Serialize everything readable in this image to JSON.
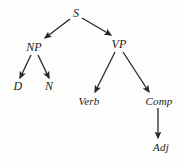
{
  "diagram": {
    "background_color": "#fdfdfb",
    "stroke_color": "#262626",
    "text_color": "#1b1b1b",
    "nodes": [
      {
        "id": "S",
        "label": "S",
        "x": 76,
        "y": 13,
        "font_size": 12
      },
      {
        "id": "NP",
        "label": "NP",
        "x": 34,
        "y": 47,
        "font_size": 12
      },
      {
        "id": "VP",
        "label": "VP",
        "x": 119,
        "y": 44,
        "font_size": 12
      },
      {
        "id": "D",
        "label": "D",
        "x": 18,
        "y": 86,
        "font_size": 12
      },
      {
        "id": "N",
        "label": "N",
        "x": 49,
        "y": 86,
        "font_size": 12
      },
      {
        "id": "Verb",
        "label": "Verb",
        "x": 89,
        "y": 101,
        "font_size": 11
      },
      {
        "id": "Comp",
        "label": "Comp",
        "x": 159,
        "y": 101,
        "font_size": 11
      },
      {
        "id": "Adj",
        "label": "Adj",
        "x": 161,
        "y": 147,
        "font_size": 11
      }
    ],
    "edges": [
      {
        "from": "S",
        "to": "NP",
        "x1": 70,
        "y1": 19,
        "x2": 45,
        "y2": 38
      },
      {
        "from": "S",
        "to": "VP",
        "x1": 82,
        "y1": 18,
        "x2": 111,
        "y2": 35
      },
      {
        "from": "NP",
        "to": "D",
        "x1": 31,
        "y1": 55,
        "x2": 20,
        "y2": 78
      },
      {
        "from": "NP",
        "to": "N",
        "x1": 38,
        "y1": 55,
        "x2": 49,
        "y2": 78
      },
      {
        "from": "VP",
        "to": "Verb",
        "x1": 115,
        "y1": 52,
        "x2": 95,
        "y2": 92
      },
      {
        "from": "VP",
        "to": "Comp",
        "x1": 123,
        "y1": 52,
        "x2": 149,
        "y2": 92
      },
      {
        "from": "Comp",
        "to": "Adj",
        "x1": 158,
        "y1": 108,
        "x2": 158,
        "y2": 138
      }
    ]
  }
}
